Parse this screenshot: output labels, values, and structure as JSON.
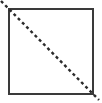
{
  "figure": {
    "type": "geometric-diagram",
    "canvas": {
      "width": 102,
      "height": 103,
      "background_color": "#ffffff"
    },
    "shapes": {
      "square": {
        "name": "square-outline",
        "x": 8,
        "y": 8,
        "width": 86,
        "height": 87,
        "stroke_color": "#3a3a3a",
        "stroke_width": 2,
        "fill": "none"
      },
      "diagonal": {
        "name": "dashed-diagonal",
        "x1": 1,
        "y1": 1,
        "x2": 99,
        "y2": 100,
        "stroke_color": "#2b2b2b",
        "stroke_width": 2.4,
        "dash_length": 3,
        "gap_length": 3,
        "direction": "top-left-to-bottom-right"
      }
    },
    "labels": {
      "alt_text": "A square outline with a dashed line drawn across its diagonal from the top-left corner to the bottom-right corner."
    }
  }
}
